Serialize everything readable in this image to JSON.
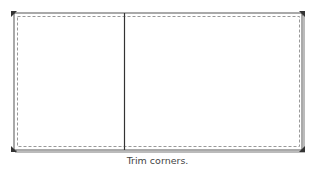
{
  "diagram": {
    "caption": "Trim corners.",
    "panels": [
      "left-panel",
      "right-panel"
    ],
    "corner_markers": [
      "top-left",
      "top-right",
      "bottom-left",
      "bottom-right"
    ],
    "colors": {
      "outline": "#444444",
      "shadow": "#aaaaaa",
      "dashed": "#999999",
      "marker": "#333333",
      "caption": "#444444"
    }
  }
}
